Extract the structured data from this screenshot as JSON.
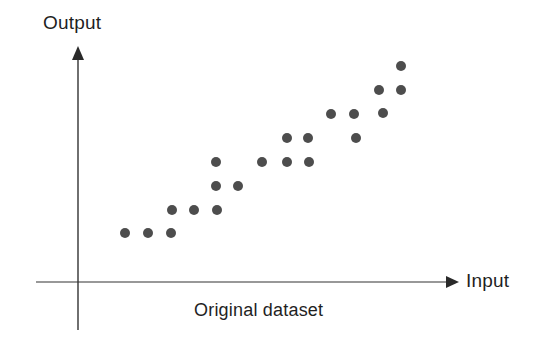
{
  "figure": {
    "caption": "Original dataset",
    "background_color": "#ffffff"
  },
  "axes": {
    "x_label": "Input",
    "y_label": "Output",
    "axis_color": "#333333",
    "x_axis_y_px": 282,
    "y_axis_x_px": 78,
    "x_axis_start_px": 36,
    "x_axis_end_px": 452,
    "y_axis_top_px": 48,
    "y_axis_bottom_px": 330,
    "arrowheads": [
      "x-axis-arrowhead",
      "y-axis-arrowhead"
    ]
  },
  "chart_data": {
    "type": "scatter",
    "title": "Original dataset",
    "xlabel": "Input",
    "ylabel": "Output",
    "grid": false,
    "legend": null,
    "marker": {
      "shape": "circle",
      "color": "#4d4d4d",
      "diameter_px": 10
    },
    "xlim": [
      0,
      100
    ],
    "ylim": [
      0,
      100
    ],
    "n_points": 22,
    "points_px": [
      {
        "x": 125,
        "y": 233
      },
      {
        "x": 148,
        "y": 233
      },
      {
        "x": 171,
        "y": 233
      },
      {
        "x": 172,
        "y": 210
      },
      {
        "x": 194,
        "y": 210
      },
      {
        "x": 217,
        "y": 210
      },
      {
        "x": 216,
        "y": 186
      },
      {
        "x": 238,
        "y": 186
      },
      {
        "x": 216,
        "y": 162
      },
      {
        "x": 262,
        "y": 162
      },
      {
        "x": 287,
        "y": 162
      },
      {
        "x": 309,
        "y": 162
      },
      {
        "x": 287,
        "y": 138
      },
      {
        "x": 308,
        "y": 138
      },
      {
        "x": 356,
        "y": 138
      },
      {
        "x": 331,
        "y": 114
      },
      {
        "x": 354,
        "y": 114
      },
      {
        "x": 383,
        "y": 113
      },
      {
        "x": 379,
        "y": 90
      },
      {
        "x": 401,
        "y": 90
      },
      {
        "x": 401,
        "y": 66
      },
      {
        "x": 262,
        "y": 162
      }
    ],
    "x": [
      11.3,
      16.8,
      22.2,
      22.4,
      27.9,
      33.4,
      33.2,
      38.5,
      33.2,
      44.2,
      50.2,
      55.5,
      50.2,
      55.3,
      66.8,
      60.8,
      66.3,
      73.3,
      72.4,
      77.6,
      77.6
    ],
    "y": [
      17.4,
      17.4,
      17.4,
      25.5,
      25.5,
      25.5,
      34.0,
      34.0,
      42.6,
      42.6,
      42.6,
      42.6,
      51.1,
      51.1,
      51.1,
      59.6,
      59.6,
      59.9,
      68.1,
      68.1,
      76.6
    ]
  }
}
